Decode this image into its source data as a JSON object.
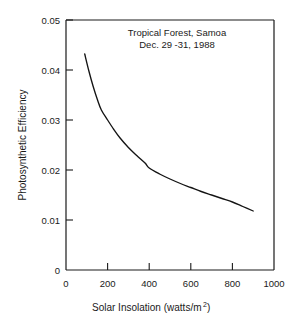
{
  "chart_data": {
    "type": "line",
    "title": "Tropical Forest, Samoa",
    "subtitle": "Dec. 29 -31, 1988",
    "xlabel": "Solar Insolation   (watts/m",
    "xlabel_sup": "2",
    "xlabel_tail": ")",
    "xlabel_full": "Solar Insolation  (watts/m2)",
    "ylabel": "Photosynthetic Efficiency",
    "xlim": [
      0,
      1000
    ],
    "ylim": [
      0,
      0.05
    ],
    "xticks": [
      "0",
      "200",
      "400",
      "600",
      "800",
      "1000"
    ],
    "xtick_values": [
      0,
      200,
      400,
      600,
      800,
      1000
    ],
    "yticks": [
      "0",
      "0.01",
      "0.02",
      "0.03",
      "0.04",
      "0.05"
    ],
    "ytick_values": [
      0,
      0.01,
      0.02,
      0.03,
      0.04,
      0.05
    ],
    "grid": false,
    "legend": false,
    "series": [
      {
        "name": "Photosynthetic efficiency vs solar insolation",
        "x": [
          90,
          110,
          130,
          150,
          170,
          200,
          230,
          260,
          300,
          340,
          380,
          400,
          450,
          500,
          550,
          600,
          650,
          700,
          750,
          800,
          850,
          900
        ],
        "y": [
          0.0432,
          0.0398,
          0.0368,
          0.0342,
          0.032,
          0.03,
          0.0281,
          0.0264,
          0.0245,
          0.0229,
          0.0214,
          0.0204,
          0.0192,
          0.0182,
          0.0173,
          0.0165,
          0.0157,
          0.015,
          0.0143,
          0.0136,
          0.0127,
          0.0118
        ]
      }
    ]
  },
  "annotations": {
    "title_line_1": "Tropical Forest, Samoa",
    "title_line_2": "Dec. 29 -31, 1988"
  }
}
